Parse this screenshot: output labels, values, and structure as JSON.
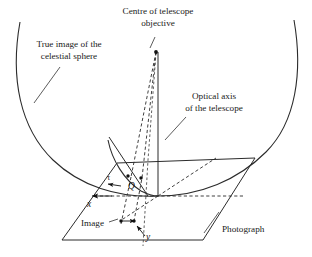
{
  "figure": {
    "kind": "optics-geometry-diagram",
    "background_color": "#ffffff",
    "line_color": "#2b2b2b",
    "width": 312,
    "height": 257
  },
  "labels": {
    "centre_objective_line1": "Centre of telescope",
    "centre_objective_line2": "objective",
    "true_image_line1": "True image of the",
    "true_image_line2": "celestial sphere",
    "optical_axis_line1": "Optical axis",
    "optical_axis_line2": "of the telescope",
    "photograph": "Photograph",
    "image": "Image",
    "axis_x": "x",
    "axis_y": "y",
    "point_q": "Q",
    "angle_tau": "τ"
  },
  "geometry": {
    "apex": {
      "x": 156,
      "y": 52
    },
    "origin": {
      "x": 158,
      "y": 196
    },
    "sphere_point_q": {
      "x": 131,
      "y": 177
    },
    "image_point": {
      "x": 133,
      "y": 220
    },
    "photograph_corners": {
      "top_left": {
        "x": 117,
        "y": 163
      },
      "top_right": {
        "x": 255,
        "y": 158
      },
      "bottom_right": {
        "x": 203,
        "y": 240
      },
      "bottom_left": {
        "x": 62,
        "y": 240
      }
    },
    "celestial_arc": {
      "left_start": {
        "x": 20,
        "y": 22
      },
      "right_start": {
        "x": 294,
        "y": 20
      }
    }
  }
}
